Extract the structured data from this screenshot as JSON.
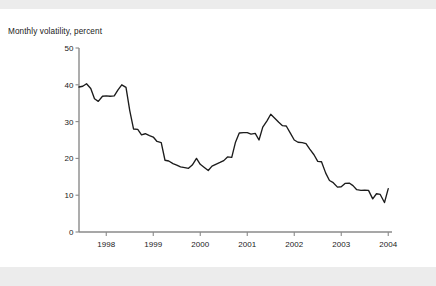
{
  "figure": {
    "background_color": "#ffffff",
    "scan_band_color": "#ececec",
    "ghost_title_fragment": "",
    "axis_color": "#8a8a8a",
    "line_color": "#1c1c1c"
  },
  "chart_data": {
    "type": "line",
    "title": "",
    "subtitle": "",
    "xlabel": "",
    "ylabel": "Monthly volatility, percent",
    "ylim": [
      0,
      50
    ],
    "yticks": [
      0,
      10,
      20,
      30,
      40,
      50
    ],
    "ytick_labels": [
      "0",
      "10",
      "20",
      "30",
      "40",
      "50"
    ],
    "xlim": [
      1997.42,
      2004.08
    ],
    "xticks": [
      1998,
      1999,
      2000,
      2001,
      2002,
      2003,
      2004
    ],
    "xtick_labels": [
      "1998",
      "1999",
      "2000",
      "2001",
      "2002",
      "2003",
      "2004"
    ],
    "grid": false,
    "legend": false,
    "legend_position": "none",
    "series": [
      {
        "name": "Monthly volatility",
        "color": "#1c1c1c",
        "x": [
          1997.42,
          1997.5,
          1997.58,
          1997.67,
          1997.75,
          1997.83,
          1997.92,
          1998.0,
          1998.08,
          1998.17,
          1998.25,
          1998.33,
          1998.42,
          1998.5,
          1998.58,
          1998.67,
          1998.75,
          1998.83,
          1998.92,
          1999.0,
          1999.08,
          1999.17,
          1999.25,
          1999.33,
          1999.42,
          1999.5,
          1999.58,
          1999.67,
          1999.75,
          1999.83,
          1999.92,
          2000.0,
          2000.08,
          2000.17,
          2000.25,
          2000.33,
          2000.42,
          2000.5,
          2000.58,
          2000.67,
          2000.75,
          2000.83,
          2000.92,
          2001.0,
          2001.08,
          2001.17,
          2001.25,
          2001.33,
          2001.42,
          2001.5,
          2001.58,
          2001.67,
          2001.75,
          2001.83,
          2001.92,
          2002.0,
          2002.08,
          2002.17,
          2002.25,
          2002.33,
          2002.42,
          2002.5,
          2002.58,
          2002.67,
          2002.75,
          2002.83,
          2002.92,
          2003.0,
          2003.08,
          2003.17,
          2003.25,
          2003.33,
          2003.42,
          2003.5,
          2003.58,
          2003.67,
          2003.75,
          2003.83,
          2003.92,
          2004.0
        ],
        "y": [
          39.4,
          39.6,
          40.3,
          39.0,
          36.2,
          35.5,
          36.9,
          37.0,
          36.9,
          37.0,
          38.6,
          40.0,
          39.3,
          33.0,
          28.0,
          27.9,
          26.4,
          26.7,
          26.2,
          25.8,
          24.6,
          24.3,
          19.5,
          19.3,
          18.6,
          18.2,
          17.7,
          17.5,
          17.3,
          18.2,
          20.0,
          18.4,
          17.6,
          16.7,
          17.9,
          18.4,
          18.9,
          19.4,
          20.4,
          20.3,
          24.4,
          26.9,
          27.0,
          27.0,
          26.6,
          26.8,
          25.0,
          28.5,
          30.2,
          32.0,
          31.0,
          29.8,
          28.9,
          28.8,
          26.8,
          25.0,
          24.4,
          24.3,
          24.0,
          22.5,
          21.0,
          19.2,
          19.1,
          16.0,
          14.0,
          13.4,
          12.2,
          12.3,
          13.2,
          13.3,
          12.6,
          11.5,
          11.3,
          11.4,
          11.3,
          9.0,
          10.4,
          10.2,
          8.0,
          11.8
        ]
      }
    ]
  }
}
